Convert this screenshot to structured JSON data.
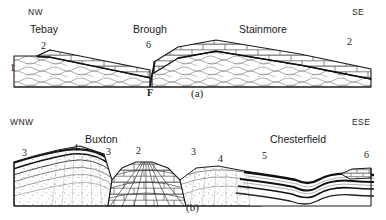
{
  "figure": {
    "panels": [
      {
        "id": "a",
        "caption": "(a)",
        "compass_left": "NW",
        "compass_right": "SE",
        "places": [
          {
            "name": "Tebay",
            "x": 30,
            "y": 26
          },
          {
            "name": "Brough",
            "x": 133,
            "y": 26
          },
          {
            "name": "Stainmore",
            "x": 239,
            "y": 26
          }
        ],
        "unit_labels": [
          {
            "text": "1",
            "x": 10,
            "y": 68
          },
          {
            "text": "2",
            "x": 41,
            "y": 46
          },
          {
            "text": "6",
            "x": 146,
            "y": 44
          },
          {
            "text": "2",
            "x": 347,
            "y": 41
          }
        ],
        "fault_label": {
          "text": "F",
          "x": 153,
          "y": 90
        },
        "compass_left_pos": {
          "x": 28,
          "y": 8
        },
        "compass_right_pos": {
          "x": 352,
          "y": 8
        },
        "caption_pos": {
          "x": 191,
          "y": 89
        }
      },
      {
        "id": "b",
        "caption": "(b)",
        "compass_left": "WNW",
        "compass_right": "ESE",
        "places": [
          {
            "name": "Buxton",
            "x": 85,
            "y": 26
          },
          {
            "name": "Chesterfield",
            "x": 270,
            "y": 26
          }
        ],
        "unit_labels": [
          {
            "text": "3",
            "x": 22,
            "y": 41
          },
          {
            "text": "4",
            "x": 73,
            "y": 37
          },
          {
            "text": "3",
            "x": 106,
            "y": 41
          },
          {
            "text": "2",
            "x": 136,
            "y": 40
          },
          {
            "text": "3",
            "x": 191,
            "y": 41
          },
          {
            "text": "4",
            "x": 218,
            "y": 48
          },
          {
            "text": "5",
            "x": 262,
            "y": 45
          },
          {
            "text": "6",
            "x": 364,
            "y": 44
          }
        ],
        "compass_left_pos": {
          "x": 10,
          "y": 8
        },
        "compass_right_pos": {
          "x": 352,
          "y": 8
        },
        "caption_pos": {
          "x": 186,
          "y": 93
        }
      }
    ],
    "colors": {
      "ink": "#1a1a1a",
      "line": "#222222",
      "hatch": "#555555",
      "background": "#ffffff"
    }
  }
}
